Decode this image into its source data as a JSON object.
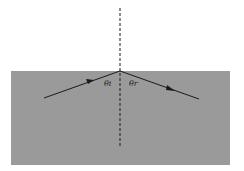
{
  "diagram": {
    "type": "reflection",
    "colors": {
      "background": "#ffffff",
      "medium": "#9a9a9a",
      "ray": "#1a1a1a",
      "normal": "#1a1a1a"
    },
    "labels": {
      "incident_angle": "θi",
      "reflected_angle": "θr"
    },
    "geometry": {
      "surface_y": 71,
      "normal_x": 120,
      "incident_start": [
        44,
        98
      ],
      "reflected_end": [
        199,
        99
      ]
    }
  }
}
